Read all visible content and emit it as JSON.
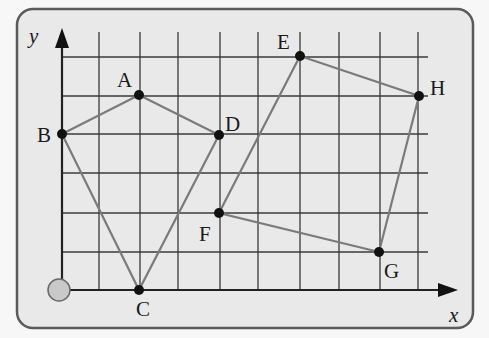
{
  "diagram": {
    "title": "",
    "axes": {
      "x_label": "x",
      "y_label": "y"
    },
    "grid": {
      "x_lines": [
        62,
        99,
        140,
        178,
        220,
        258,
        300,
        339,
        380,
        418
      ],
      "y_lines": [
        57,
        96,
        134,
        173,
        213,
        252,
        290
      ],
      "x_range": [
        0,
        9
      ],
      "y_range": [
        0,
        6
      ]
    },
    "points": [
      {
        "label": "A",
        "x": 2,
        "y": 5
      },
      {
        "label": "B",
        "x": 0,
        "y": 4
      },
      {
        "label": "C",
        "x": 2,
        "y": 0
      },
      {
        "label": "D",
        "x": 4,
        "y": 4
      },
      {
        "label": "E",
        "x": 6,
        "y": 6
      },
      {
        "label": "F",
        "x": 4,
        "y": 2
      },
      {
        "label": "G",
        "x": 8,
        "y": 1
      },
      {
        "label": "H",
        "x": 9,
        "y": 5
      }
    ],
    "shapes": [
      {
        "name": "quadrilateral ABCD",
        "vertices": [
          "A",
          "D",
          "C",
          "B"
        ]
      },
      {
        "name": "quadrilateral EFGH",
        "vertices": [
          "E",
          "F",
          "G",
          "H"
        ]
      }
    ],
    "labels": {
      "A": "A",
      "B": "B",
      "C": "C",
      "D": "D",
      "E": "E",
      "F": "F",
      "G": "G",
      "H": "H"
    },
    "colors": {
      "frame_fill": "#e9e9e9",
      "frame_stroke": "#5a5a5a",
      "grid": "#3a3a3a",
      "segments": "#7a7a7a",
      "points": "#111111",
      "origin_marker": "#c9c9c9"
    }
  }
}
